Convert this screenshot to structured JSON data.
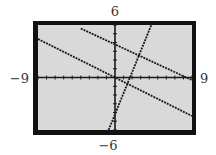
{
  "chart_data": {
    "type": "line",
    "title": "",
    "xlabel": "",
    "ylabel": "",
    "xlim": [
      -9,
      9
    ],
    "ylim": [
      -6,
      6
    ],
    "x_tick_step": 1,
    "y_tick_step": 1,
    "grid": false,
    "legend": "none",
    "window_labels": {
      "xmin": "−9",
      "xmax": "9",
      "ymin": "−6",
      "ymax": "6"
    },
    "series": [
      {
        "name": "line-upper",
        "style": "dotted",
        "slope": -0.46,
        "intercept": 3.8,
        "x": [
          -4,
          9
        ],
        "y": [
          5.6,
          -0.3
        ]
      },
      {
        "name": "line-middle",
        "style": "dotted",
        "slope": -0.49,
        "intercept": 0.0,
        "x": [
          -9,
          9
        ],
        "y": [
          4.4,
          -4.4
        ]
      },
      {
        "name": "line-steep",
        "style": "dotted",
        "slope": 2.4,
        "intercept": -4.2,
        "x": [
          -0.75,
          4.25
        ],
        "y": [
          -6,
          6
        ]
      }
    ]
  },
  "colors": {
    "frame": "#111111",
    "plot_bg": "#d9d9d9",
    "axis": "#1a1a1a",
    "line": "#1a1a1a",
    "label": "#333333"
  }
}
